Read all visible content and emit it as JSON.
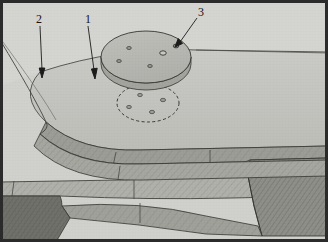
{
  "figure": {
    "type": "technical-line-drawing",
    "width": 328,
    "height": 242,
    "background_color": "#cfcfcc",
    "frame_color": "#2b2b2b",
    "line_color": "#2f2f2f"
  },
  "callouts": [
    {
      "id": "callout-2",
      "label": "2",
      "label_x": 36,
      "label_y": 14,
      "tip_x": 42,
      "tip_y": 75,
      "target": "platform-outer-curve-edge"
    },
    {
      "id": "callout-1",
      "label": "1",
      "label_x": 85,
      "label_y": 14,
      "tip_x": 95,
      "tip_y": 76,
      "target": "platform-top-surface-edge"
    },
    {
      "id": "callout-3",
      "label": "3",
      "label_x": 199,
      "label_y": 8,
      "tip_x": 176,
      "tip_y": 46,
      "target": "disc-mounting-hole"
    }
  ],
  "parts": {
    "upper_disc": {
      "name": "circular disc plate",
      "center_x": 146,
      "center_y": 57,
      "radius_x": 45,
      "radius_y": 26,
      "thickness": 9,
      "face_color": "#b9b9b5",
      "edge_color": "#a4a49f",
      "hole_count": 5,
      "holes": [
        {
          "x": 129,
          "y": 48,
          "r": 2.0
        },
        {
          "x": 163,
          "y": 53,
          "r": 3.0
        },
        {
          "x": 119,
          "y": 61,
          "r": 2.0
        },
        {
          "x": 150,
          "y": 65,
          "r": 2.0
        },
        {
          "x": 176,
          "y": 46,
          "r": 2.6
        }
      ]
    },
    "footprint_ellipse": {
      "name": "dashed mounting footprint",
      "center_x": 148,
      "center_y": 103,
      "radius_x": 31,
      "radius_y": 19,
      "stroke_style": "dashed",
      "hole_count": 4,
      "holes": [
        {
          "x": 140,
          "y": 95,
          "r": 2.0
        },
        {
          "x": 163,
          "y": 100,
          "r": 2.2
        },
        {
          "x": 129,
          "y": 107,
          "r": 2.0
        },
        {
          "x": 152,
          "y": 112,
          "r": 2.2
        }
      ]
    },
    "platform": {
      "name": "curved platform top surface",
      "top_color": "#c4c4c0",
      "rim_color": "#9a9a94",
      "rim_height": 14
    },
    "layers": [
      {
        "name": "upper-ramp-band",
        "fill": "#a8a8a2",
        "hatch": true
      },
      {
        "name": "mid-step-band",
        "fill": "#b2b2ac",
        "hatch": true
      },
      {
        "name": "lower-wedge-band",
        "fill": "#9d9d97",
        "hatch": true
      },
      {
        "name": "floor-band",
        "fill": "#8f8f89",
        "hatch": true
      },
      {
        "name": "shadow-corner",
        "fill": "#6e6e68",
        "hatch": true
      }
    ]
  }
}
